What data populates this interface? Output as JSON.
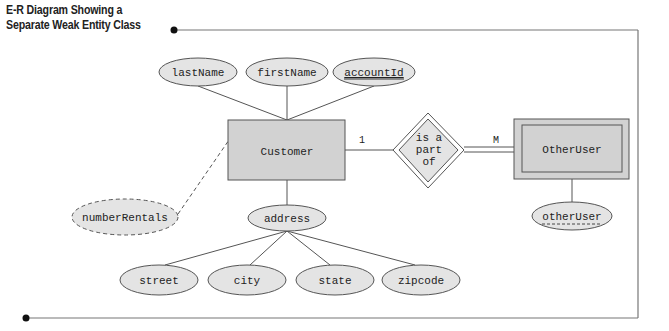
{
  "title": {
    "line1": "E-R Diagram Showing a",
    "line2": "Separate Weak Entity Class"
  },
  "colors": {
    "fill": "#e4e4e4",
    "entity_fill": "#d2d2d2",
    "stroke": "#555555",
    "frame": "#777777"
  },
  "entities": {
    "customer": {
      "label": "Customer"
    },
    "other_user": {
      "label": "OtherUser",
      "weak": true
    }
  },
  "relationship": {
    "label_line1": "is a",
    "label_line2": "part",
    "label_line3": "of",
    "identifying": true,
    "cardinality_left": "1",
    "cardinality_right": "M"
  },
  "attributes": {
    "last_name": {
      "label": "lastName"
    },
    "first_name": {
      "label": "firstName"
    },
    "account_id": {
      "label": "accountId",
      "key": true
    },
    "number_rentals": {
      "label": "numberRentals",
      "derived": true
    },
    "address": {
      "label": "address",
      "composite": true
    },
    "street": {
      "label": "street"
    },
    "city": {
      "label": "city"
    },
    "state": {
      "label": "state"
    },
    "zipcode": {
      "label": "zipcode"
    },
    "other_user": {
      "label": "otherUser",
      "partial_key": true
    }
  }
}
